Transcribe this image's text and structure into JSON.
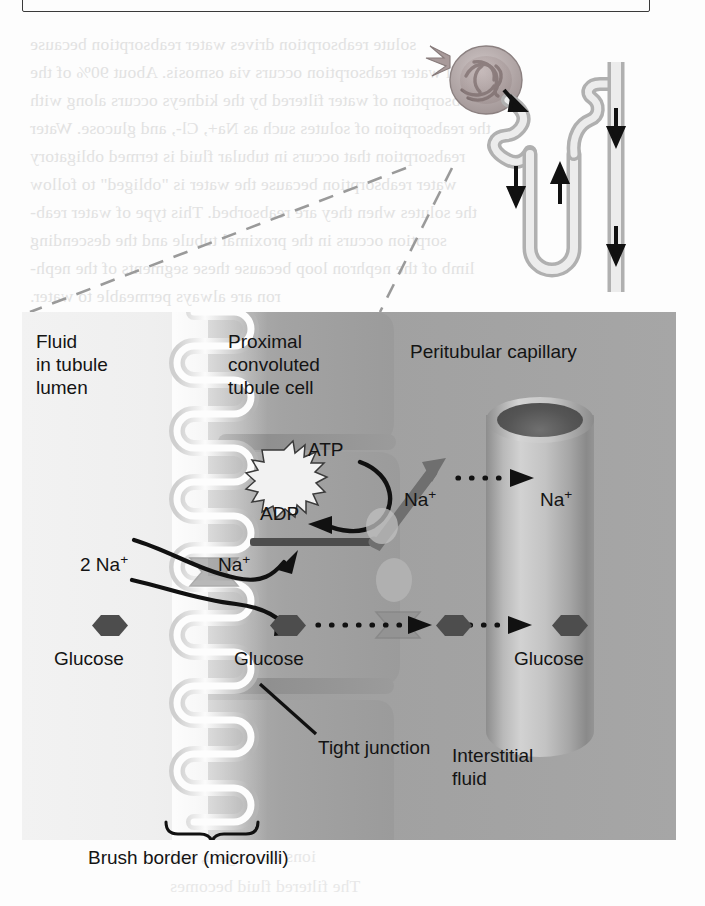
{
  "figure": {
    "kind": "nephron-reabsorption-diagram",
    "top_box_text": "y,    glucose is reabsorbed in the",
    "panel_labels": {
      "lumen": "Fluid\nin tubule\nlumen",
      "cell": "Proximal\nconvoluted\ntubule cell",
      "capillary": "Peritubular capillary",
      "interstitium": "Interstitial\nfluid",
      "tight_junction": "Tight junction",
      "brush_border": "Brush border (microvilli)"
    },
    "molecules": {
      "sodium_lumen": "2 Na",
      "sodium_lumen_charge": "+",
      "sodium_cell": "Na",
      "sodium_cell_charge": "+",
      "sodium_interstitium": "Na",
      "sodium_interstitium_charge": "+",
      "sodium_capillary": "Na",
      "sodium_capillary_charge": "+",
      "glucose_lumen": "Glucose",
      "glucose_cell": "Glucose",
      "glucose_capillary": "Glucose",
      "atp": "ATP",
      "adp": "ADP"
    },
    "ghost_text_lines": [
      "solute reabsorption drives water reabsorption because",
      "all water reabsorption occurs via osmosis. About 90% of the",
      "reabsorption of water filtered by the kidneys occurs along with",
      "the reabsorption of solutes such as Na+, Cl-, and glucose. Water",
      "reabsorption that occurs in tubular fluid is termed obligatory",
      "water reabsorption because the water is \"obliged\" to follow",
      "the solutes when they are reabsorbed. This type of water reab-",
      "sorption occurs in the proximal tubule and the descending",
      "limb of the nephron loop because these segments of the neph-",
      "ron are always permeable to water.",
      "the kidney tubule is not always permeable to water and",
      "does not occur to the same extent throughout the",
      "cell."
    ],
    "ghost_text_lower": [
      "renal trans-",
      "proximal convo-",
      "distal convoluted",
      "segment, we will",
      "ions flow again, and",
      "The filtered fluid becomes"
    ],
    "colors": {
      "lumen_bg": "#f0f0f0",
      "cell_bg": "#9a9a9a",
      "molecule": "#4d4d4d",
      "ink": "#141414",
      "ghost": "#e8e8e8",
      "transporter": "#8c8c8c"
    }
  }
}
